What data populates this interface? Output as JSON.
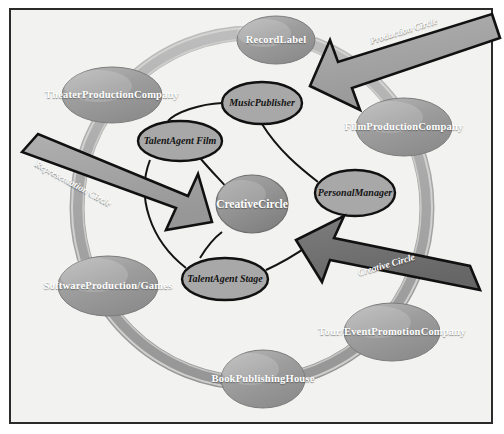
{
  "diagram": {
    "background_color": "#f2f2f0",
    "border_color": "#2b2b2b",
    "outer_node_fill": "#9a9a9a",
    "inner_node_fill": "#a8a8a8",
    "center_node_fill": "#8f8f8f",
    "ring_color": "#a8a8a8",
    "arrow_fill_light": "#a3a3a3",
    "arrow_fill_dark": "#6f6f6f",
    "arrow_outline": "#111111"
  },
  "outer_nodes": [
    {
      "id": "record-label",
      "label": "Record\nLabel",
      "cx": 276,
      "cy": 40,
      "rx": 39,
      "ry": 24
    },
    {
      "id": "theater-production-company",
      "label": "Theater\nProduction\nCompany",
      "cx": 112,
      "cy": 95,
      "rx": 50,
      "ry": 28
    },
    {
      "id": "film-production-company",
      "label": "Film\nProduction\nCompany",
      "cx": 404,
      "cy": 127,
      "rx": 48,
      "ry": 29
    },
    {
      "id": "software-production-games",
      "label": "Software\nProduction/\nGames",
      "cx": 108,
      "cy": 286,
      "rx": 50,
      "ry": 30
    },
    {
      "id": "tour-event-promotion-company",
      "label": "Tour/Event\nPromotion\nCompany",
      "cx": 392,
      "cy": 332,
      "rx": 48,
      "ry": 29
    },
    {
      "id": "book-publishing-house",
      "label": "Book\nPublishing\nHouse",
      "cx": 263,
      "cy": 379,
      "rx": 42,
      "ry": 29
    }
  ],
  "inner_nodes": [
    {
      "id": "music-publisher",
      "label": "Music\nPublisher",
      "cx": 262,
      "cy": 103,
      "rx": 40,
      "ry": 21
    },
    {
      "id": "talent-agent-film",
      "label": "Talent\nAgent Film",
      "cx": 180,
      "cy": 141,
      "rx": 42,
      "ry": 20
    },
    {
      "id": "personal-manager",
      "label": "Personal\nManager",
      "cx": 355,
      "cy": 193,
      "rx": 40,
      "ry": 23
    },
    {
      "id": "talent-agent-stage",
      "label": "Talent\nAgent Stage",
      "cx": 225,
      "cy": 279,
      "rx": 43,
      "ry": 21
    }
  ],
  "center_node": {
    "id": "creative-circle",
    "label": "Creative\nCircle",
    "cx": 252,
    "cy": 204,
    "rx": 36,
    "ry": 29
  },
  "arrows": [
    {
      "id": "production-circle",
      "label": "Production Circle",
      "tone": "light",
      "label_x": 370,
      "label_y": 36,
      "label_rotate": -17
    },
    {
      "id": "representation-circle",
      "label": "Representation Circle",
      "tone": "light",
      "label_x": 36,
      "label_y": 158,
      "label_rotate": 29
    },
    {
      "id": "creative-circle-arrow",
      "label": "Creative Circle",
      "tone": "dark",
      "label_x": 358,
      "label_y": 268,
      "label_rotate": -16
    }
  ]
}
